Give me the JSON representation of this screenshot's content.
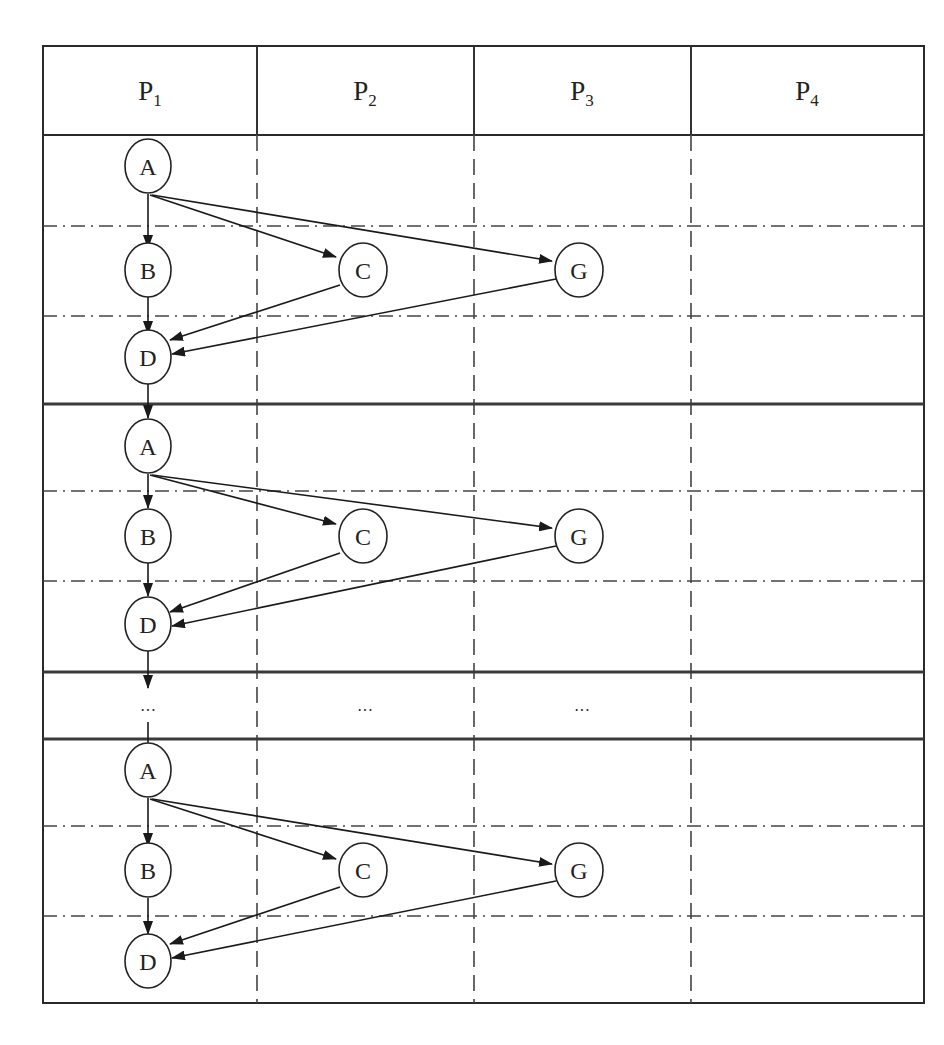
{
  "diagram": {
    "type": "processor-task-schedule",
    "columns": [
      {
        "id": "P1",
        "base": "P",
        "sub": "1"
      },
      {
        "id": "P2",
        "base": "P",
        "sub": "2"
      },
      {
        "id": "P3",
        "base": "P",
        "sub": "3"
      },
      {
        "id": "P4",
        "base": "P",
        "sub": "4"
      }
    ],
    "ellipsis": "···",
    "iterations": [
      {
        "nodes": [
          {
            "id": "A",
            "label": "A",
            "processor": "P1"
          },
          {
            "id": "B",
            "label": "B",
            "processor": "P1"
          },
          {
            "id": "C",
            "label": "C",
            "processor": "P2"
          },
          {
            "id": "G",
            "label": "G",
            "processor": "P3"
          },
          {
            "id": "D",
            "label": "D",
            "processor": "P1"
          }
        ],
        "edges": [
          [
            "A",
            "B"
          ],
          [
            "A",
            "C"
          ],
          [
            "A",
            "G"
          ],
          [
            "B",
            "D"
          ],
          [
            "C",
            "D"
          ],
          [
            "G",
            "D"
          ]
        ]
      },
      {
        "nodes": [
          {
            "id": "A",
            "label": "A",
            "processor": "P1"
          },
          {
            "id": "B",
            "label": "B",
            "processor": "P1"
          },
          {
            "id": "C",
            "label": "C",
            "processor": "P2"
          },
          {
            "id": "G",
            "label": "G",
            "processor": "P3"
          },
          {
            "id": "D",
            "label": "D",
            "processor": "P1"
          }
        ],
        "edges": [
          [
            "A",
            "B"
          ],
          [
            "A",
            "C"
          ],
          [
            "A",
            "G"
          ],
          [
            "B",
            "D"
          ],
          [
            "C",
            "D"
          ],
          [
            "G",
            "D"
          ]
        ]
      },
      {
        "nodes": [
          {
            "id": "A",
            "label": "A",
            "processor": "P1"
          },
          {
            "id": "B",
            "label": "B",
            "processor": "P1"
          },
          {
            "id": "C",
            "label": "C",
            "processor": "P2"
          },
          {
            "id": "G",
            "label": "G",
            "processor": "P3"
          },
          {
            "id": "D",
            "label": "D",
            "processor": "P1"
          }
        ],
        "edges": [
          [
            "A",
            "B"
          ],
          [
            "A",
            "C"
          ],
          [
            "A",
            "G"
          ],
          [
            "B",
            "D"
          ],
          [
            "C",
            "D"
          ],
          [
            "G",
            "D"
          ]
        ]
      }
    ],
    "inter_iteration_edges": [
      [
        "D",
        "A"
      ]
    ]
  }
}
